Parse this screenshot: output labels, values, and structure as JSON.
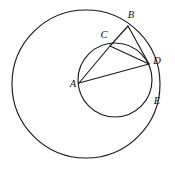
{
  "figure": {
    "background_color": "#ffffff",
    "stroke_color": "#1b1b1b",
    "label_color": "#111111",
    "width": 175,
    "height": 169
  },
  "chart_data": {
    "type": "diagram",
    "subtype": "euclidean-geometry",
    "xlabel": "",
    "ylabel": "",
    "xlim": [
      0,
      175
    ],
    "ylim": [
      169,
      0
    ],
    "grid": false,
    "legend": null,
    "circles": [
      {
        "name": "large-circle",
        "cx": 86,
        "cy": 84,
        "r": 74,
        "fill": "none",
        "stroke": "#1b1b1b",
        "points_on_circle": [
          "B",
          "D",
          "E"
        ]
      },
      {
        "name": "small-circle",
        "cx": 115,
        "cy": 80,
        "r": 37,
        "fill": "none",
        "stroke": "#1b1b1b",
        "points_on_circle": [
          "A",
          "C",
          "D"
        ]
      }
    ],
    "points": [
      {
        "label": "A",
        "x": 79,
        "y": 83,
        "label_x": 73,
        "label_y": 85,
        "on": [
          "small-circle"
        ]
      },
      {
        "label": "B",
        "x": 128,
        "y": 26,
        "label_x": 131,
        "label_y": 16,
        "on": [
          "large-circle"
        ]
      },
      {
        "label": "C",
        "x": 110,
        "y": 46,
        "label_x": 104,
        "label_y": 36,
        "on": [
          "small-circle"
        ]
      },
      {
        "label": "D",
        "x": 149,
        "y": 64,
        "label_x": 157,
        "label_y": 62,
        "on": [
          "small-circle",
          "large-circle"
        ]
      },
      {
        "label": "E",
        "x": 150,
        "y": 97,
        "label_x": 157,
        "label_y": 102,
        "on": [
          "large-circle"
        ]
      }
    ],
    "segments": [
      {
        "name": "AC",
        "from": "A",
        "to": "C",
        "x1": 79,
        "y1": 83,
        "x2": 110,
        "y2": 46
      },
      {
        "name": "AD",
        "from": "A",
        "to": "D",
        "x1": 79,
        "y1": 83,
        "x2": 149,
        "y2": 64
      },
      {
        "name": "CD",
        "from": "C",
        "to": "D",
        "x1": 110,
        "y1": 46,
        "x2": 149,
        "y2": 64
      },
      {
        "name": "CB",
        "from": "C",
        "to": "B",
        "x1": 110,
        "y1": 46,
        "x2": 128,
        "y2": 26
      },
      {
        "name": "BD",
        "from": "B",
        "to": "D",
        "x1": 128,
        "y1": 26,
        "x2": 149,
        "y2": 64
      }
    ],
    "labels": [
      "A",
      "B",
      "C",
      "D",
      "E"
    ]
  }
}
